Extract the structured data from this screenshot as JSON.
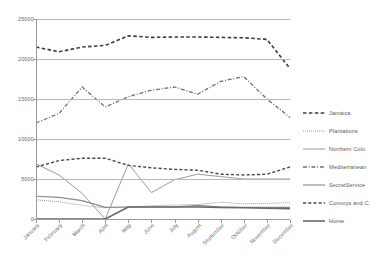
{
  "chart_data": {
    "type": "line",
    "title": "",
    "xlabel": "",
    "ylabel": "",
    "ylim": [
      0,
      25000
    ],
    "grid": true,
    "legend_position": "right",
    "categories": [
      "January",
      "February",
      "March",
      "April",
      "May",
      "June",
      "July",
      "August",
      "September",
      "October",
      "November",
      "December"
    ],
    "yticks": [
      0,
      5000,
      10000,
      15000,
      20000,
      25000
    ],
    "ytick_labels": [
      "0",
      "5000",
      "10000",
      "15000",
      "20000",
      "25000"
    ],
    "series": [
      {
        "name": "Jamaica",
        "style": "dashed",
        "color": "#3b3b3b",
        "width": 1.6,
        "values": [
          21500,
          20900,
          21500,
          21700,
          22900,
          22700,
          22750,
          22750,
          22700,
          22650,
          22450,
          18800
        ]
      },
      {
        "name": "Plantations",
        "style": "dotted",
        "color": "#8d8d8d",
        "width": 1.0,
        "values": [
          2400,
          2150,
          1700,
          1400,
          1500,
          1650,
          1750,
          1800,
          2100,
          1900,
          1950,
          2050
        ]
      },
      {
        "name": "Northern Colo",
        "style": "solid",
        "color": "#9a9a9a",
        "width": 1.0,
        "values": [
          6900,
          5500,
          3200,
          0,
          6900,
          3300,
          4900,
          5600,
          5300,
          5000,
          5000,
          5000
        ]
      },
      {
        "name": "Mediterranean",
        "style": "dashdot",
        "color": "#6d6d6d",
        "width": 1.3,
        "values": [
          12000,
          13200,
          16500,
          14000,
          15300,
          16100,
          16500,
          15600,
          17200,
          17800,
          15000,
          12700
        ]
      },
      {
        "name": "SecretService",
        "style": "solid",
        "color": "#8a8a8a",
        "width": 1.1,
        "values": [
          2850,
          2700,
          2300,
          1450,
          1500,
          1500,
          1500,
          1700,
          1500,
          1450,
          1450,
          1450
        ]
      },
      {
        "name": "Convoys and C.",
        "style": "dashed",
        "color": "#4a4a4a",
        "width": 1.4,
        "values": [
          6500,
          7300,
          7600,
          7600,
          6700,
          6400,
          6200,
          6100,
          5600,
          5500,
          5600,
          6500
        ]
      },
      {
        "name": "Home",
        "style": "solid",
        "color": "#6a6a6a",
        "width": 1.6,
        "values": [
          0,
          0,
          0,
          0,
          1500,
          1500,
          1500,
          1500,
          1450,
          1400,
          1350,
          1300
        ]
      }
    ]
  }
}
